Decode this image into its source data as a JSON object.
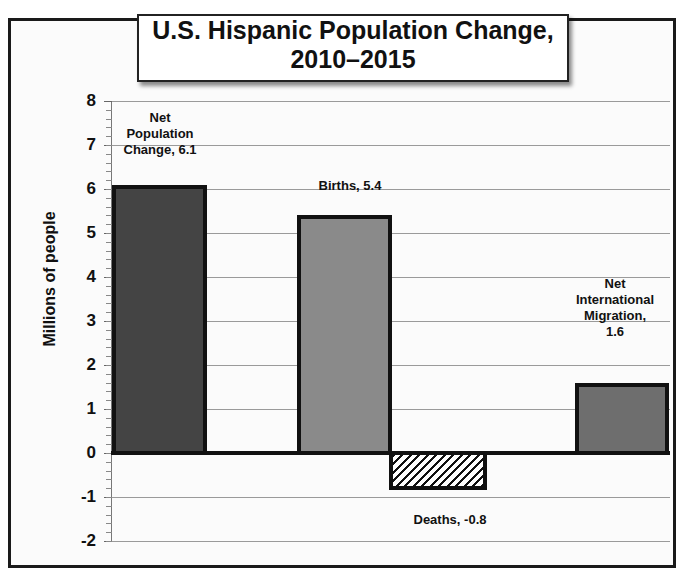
{
  "chart_data": {
    "type": "bar",
    "title": "U.S. Hispanic Population Change, 2010–2015",
    "title_lines": [
      "U.S. Hispanic Population Change,",
      "2010–2015"
    ],
    "xlabel": "",
    "ylabel": "Millions of people",
    "ylim": [
      -2,
      8
    ],
    "yticks": [
      8,
      7,
      6,
      5,
      4,
      3,
      2,
      1,
      0,
      -1,
      -2
    ],
    "grid": true,
    "legend": "none",
    "categories": [
      "Net Population Change",
      "Births",
      "Deaths",
      "Net International Migration"
    ],
    "values": [
      6.1,
      5.4,
      -0.8,
      1.6
    ],
    "colors": [
      "#444444",
      "#8a8a8a",
      "hatched",
      "#6e6e6e"
    ],
    "data_labels": [
      [
        "Net",
        "Population",
        "Change, 6.1"
      ],
      [
        "Births, 5.4"
      ],
      [
        "Deaths, -0.8"
      ],
      [
        "Net",
        "International",
        "Migration,",
        "1.6"
      ]
    ]
  }
}
